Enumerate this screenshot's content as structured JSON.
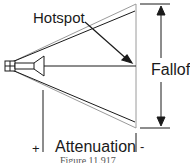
{
  "diagram": {
    "labels": {
      "hotspot": "Hotspot",
      "falloff": "Falloff",
      "attenuation": "Attenuation",
      "plus": "+",
      "minus": "-"
    },
    "caption": "Figure 11.917",
    "colors": {
      "line": "#1a1a1a",
      "outer_cone": "#9a9a9a",
      "background": "#ffffff"
    }
  }
}
